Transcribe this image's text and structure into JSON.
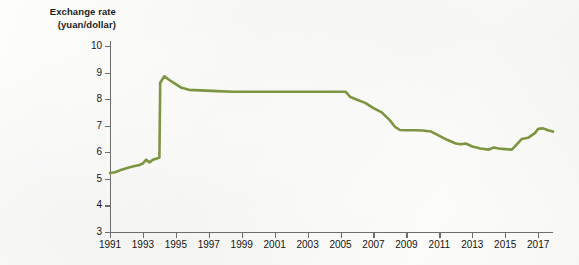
{
  "figure": {
    "axis_title_line1": "Exchange rate",
    "axis_title_line2": "(yuan/dollar)"
  },
  "chart_data": {
    "type": "line",
    "title": "Exchange rate (yuan/dollar)",
    "xlabel": "",
    "ylabel": "Exchange rate (yuan/dollar)",
    "xlim": [
      1991,
      2017.9
    ],
    "ylim": [
      3,
      10
    ],
    "grid": false,
    "legend": "none",
    "line_color": "#7d9440",
    "axis_color": "#6d6d6d",
    "background_color": "#fbfbf9",
    "y_ticks": [
      3,
      4,
      5,
      6,
      7,
      8,
      9,
      10
    ],
    "y_tick_labels": [
      "3",
      "4",
      "5",
      "6",
      "7",
      "8",
      "9",
      "10"
    ],
    "x_ticks": [
      1991,
      1993,
      1995,
      1997,
      1999,
      2001,
      2003,
      2005,
      2007,
      2009,
      2011,
      2013,
      2015,
      2017
    ],
    "x_tick_labels": [
      "1991",
      "1993",
      "1995",
      "1997",
      "1999",
      "2001",
      "2003",
      "2005",
      "2007",
      "2009",
      "2011",
      "2013",
      "2015",
      "2017"
    ],
    "series": [
      {
        "name": "Yuan per US dollar",
        "x": [
          1991.0,
          1991.3,
          1991.6,
          1991.9,
          1992.2,
          1992.5,
          1992.8,
          1993.0,
          1993.2,
          1993.4,
          1993.6,
          1993.8,
          1994.0,
          1994.05,
          1994.3,
          1994.6,
          1994.9,
          1995.3,
          1995.8,
          1996.5,
          1997.5,
          1998.5,
          1999.5,
          2000.5,
          2001.5,
          2002.5,
          2003.5,
          2004.5,
          2005.3,
          2005.6,
          2006.0,
          2006.5,
          2007.0,
          2007.5,
          2008.0,
          2008.3,
          2008.6,
          2009.0,
          2009.5,
          2010.0,
          2010.5,
          2011.0,
          2011.5,
          2012.0,
          2012.3,
          2012.6,
          2013.0,
          2013.5,
          2014.0,
          2014.3,
          2014.6,
          2015.0,
          2015.4,
          2015.8,
          2016.0,
          2016.4,
          2016.8,
          2017.0,
          2017.3,
          2017.6,
          2017.9
        ],
        "y": [
          5.22,
          5.25,
          5.32,
          5.38,
          5.44,
          5.48,
          5.52,
          5.58,
          5.72,
          5.62,
          5.72,
          5.76,
          5.8,
          8.62,
          8.86,
          8.72,
          8.6,
          8.44,
          8.35,
          8.33,
          8.3,
          8.28,
          8.28,
          8.28,
          8.28,
          8.28,
          8.28,
          8.28,
          8.28,
          8.08,
          7.98,
          7.86,
          7.66,
          7.5,
          7.2,
          6.96,
          6.84,
          6.83,
          6.83,
          6.82,
          6.78,
          6.62,
          6.46,
          6.33,
          6.3,
          6.33,
          6.22,
          6.14,
          6.1,
          6.18,
          6.14,
          6.12,
          6.1,
          6.36,
          6.5,
          6.55,
          6.72,
          6.88,
          6.9,
          6.83,
          6.78
        ]
      }
    ],
    "annotations": [
      {
        "text": "Sharp devaluation at 1994 unification of exchange rates",
        "x": 1994,
        "y": 8.7
      }
    ]
  }
}
